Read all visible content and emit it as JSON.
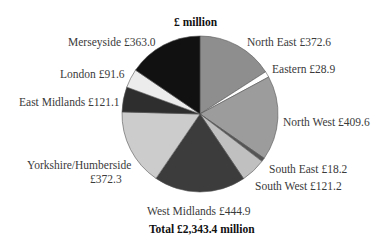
{
  "chart_data": {
    "type": "pie",
    "title": "£ million",
    "total_label": "Total £2,343.4 million",
    "start": "top",
    "direction": "clockwise",
    "slices": [
      {
        "name": "North East",
        "value": 372.6,
        "label": "North East  £372.6",
        "color": "#8e8e8e"
      },
      {
        "name": "Eastern",
        "value": 28.9,
        "label": "Eastern  £28.9",
        "color": "#ffffff"
      },
      {
        "name": "North West",
        "value": 409.6,
        "label": "North West  £409.6",
        "color": "#9c9c9c"
      },
      {
        "name": "South East",
        "value": 18.2,
        "label": "South East  £18.2",
        "color": "#555555"
      },
      {
        "name": "South West",
        "value": 121.2,
        "label": "South West  £121.2",
        "color": "#c0c0c0"
      },
      {
        "name": "West Midlands",
        "value": 444.9,
        "label": "West Midlands  £444.9",
        "color": "#3c3c3c"
      },
      {
        "name": "Yorkshire/Humberside",
        "value": 372.3,
        "label": "Yorkshire/Humberside",
        "label2": "£372.3",
        "color": "#cccccc"
      },
      {
        "name": "East Midlands",
        "value": 121.1,
        "label": "East Midlands  £121.1",
        "color": "#2e2e2e"
      },
      {
        "name": "London",
        "value": 91.6,
        "label": "London  £91.6",
        "color": "#ececec"
      },
      {
        "name": "Merseyside",
        "value": 363.0,
        "label": "Merseyside £363.0",
        "color": "#111111"
      }
    ]
  }
}
